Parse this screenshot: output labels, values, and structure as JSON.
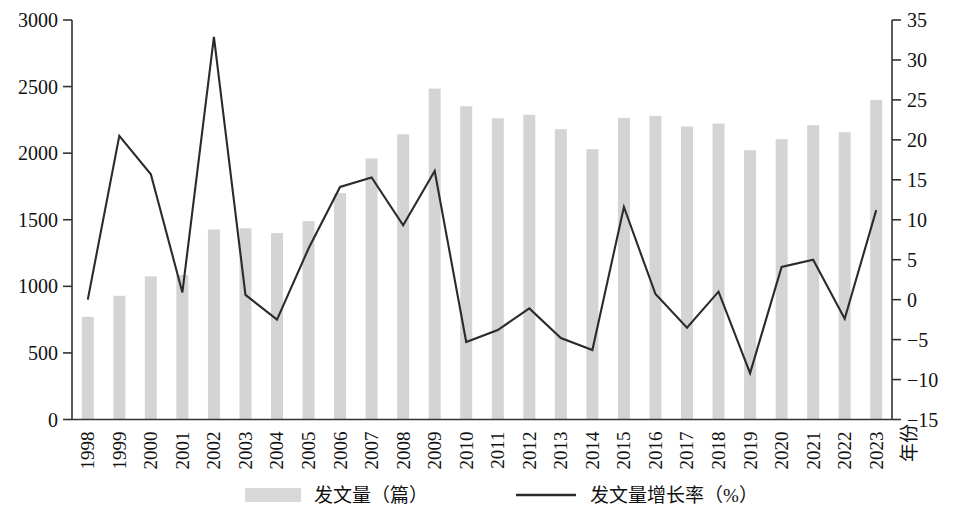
{
  "chart_data": {
    "type": "bar",
    "title": "",
    "subtitle": "",
    "xlabel": "年份",
    "ylabel": "",
    "y2label": "",
    "categories": [
      "1998",
      "1999",
      "2000",
      "2001",
      "2002",
      "2003",
      "2004",
      "2005",
      "2006",
      "2007",
      "2008",
      "2009",
      "2010",
      "2011",
      "2012",
      "2013",
      "2014",
      "2015",
      "2016",
      "2017",
      "2018",
      "2019",
      "2020",
      "2021",
      "2022",
      "2023"
    ],
    "ylim": [
      0,
      3000
    ],
    "yticks": [
      0,
      500,
      1000,
      1500,
      2000,
      2500,
      3000
    ],
    "y2lim": [
      -15,
      35
    ],
    "y2ticks": [
      -15,
      -10,
      -5,
      0,
      5,
      10,
      15,
      20,
      25,
      30,
      35
    ],
    "grid": false,
    "legend_position": "bottom",
    "series": [
      {
        "name": "发文量（篇）",
        "type": "bar",
        "axis": "left",
        "unit": "篇",
        "color": "#d4d4d4",
        "values": [
          771,
          929,
          1075,
          1085,
          1427,
          1436,
          1400,
          1490,
          1700,
          1960,
          2142,
          2485,
          2352,
          2262,
          2288,
          2180,
          2030,
          2265,
          2280,
          2200,
          2222,
          2022,
          2105,
          2210,
          2158,
          2400
        ]
      },
      {
        "name": "发文量增长率（%）",
        "type": "line",
        "axis": "right",
        "unit": "%",
        "color": "#2b2b2b",
        "values": [
          0.0,
          20.5,
          15.7,
          0.9,
          32.9,
          0.6,
          -2.5,
          6.4,
          14.1,
          15.3,
          9.3,
          16.1,
          -5.3,
          -3.8,
          -1.1,
          -4.8,
          -6.3,
          11.6,
          0.7,
          -3.5,
          1.0,
          -9.2,
          4.1,
          5.0,
          -2.4,
          11.2
        ]
      }
    ],
    "legend": [
      {
        "label": "发文量（篇）",
        "marker": "swatch"
      },
      {
        "label": "发文量增长率（%）",
        "marker": "line"
      }
    ]
  }
}
